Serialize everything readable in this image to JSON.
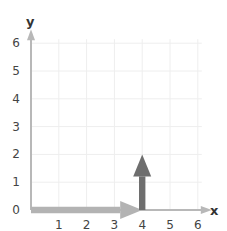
{
  "chart_data": {
    "type": "vector",
    "title": "",
    "xlabel": "x",
    "ylabel": "y",
    "xlim": [
      0,
      6
    ],
    "ylim": [
      0,
      6
    ],
    "x_ticks": [
      "1",
      "2",
      "3",
      "4",
      "5",
      "6"
    ],
    "y_ticks": [
      "0",
      "1",
      "2",
      "3",
      "4",
      "5",
      "6"
    ],
    "grid": true,
    "vectors": [
      {
        "name": "horizontal-vector",
        "from": [
          0,
          0
        ],
        "to": [
          4,
          0
        ],
        "color": "#b3b3b3"
      },
      {
        "name": "vertical-vector",
        "from": [
          4,
          0
        ],
        "to": [
          4,
          2
        ],
        "color": "#6e6e6e"
      }
    ],
    "colors": {
      "axis": "#b8b8b8",
      "grid": "#eeeeee",
      "tick_text": "#444444"
    }
  }
}
